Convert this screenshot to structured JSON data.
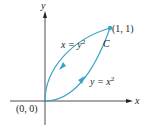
{
  "diagram": {
    "type": "closed-curve-plot",
    "axes": {
      "x_label": "x",
      "y_label": "y",
      "origin_label": "(0, 0)"
    },
    "point": {
      "label": "(1, 1)"
    },
    "curve_label": "C",
    "curves": [
      {
        "name": "upper",
        "equation_lhs": "x = y",
        "exponent": "2",
        "direction": "toward origin"
      },
      {
        "name": "lower",
        "equation_lhs": "y = x",
        "exponent": "2",
        "direction": "toward (1, 1)"
      }
    ],
    "colors": {
      "curve": "#3fa2c9",
      "axis": "#231f20",
      "text": "#231f20"
    }
  }
}
